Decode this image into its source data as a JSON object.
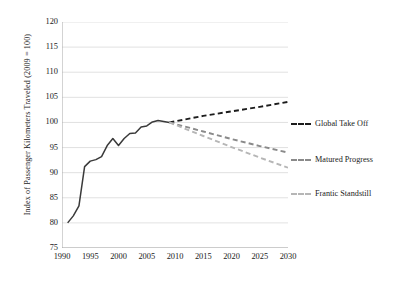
{
  "chart_data": {
    "type": "line",
    "title": "",
    "xlabel": "",
    "ylabel": "Index of Passenger Kilometers Traveled (2009 = 100)",
    "xlim": [
      1990,
      2030
    ],
    "ylim": [
      75,
      120
    ],
    "xticks": [
      "1990",
      "1995",
      "2000",
      "2005",
      "2010",
      "2015",
      "2020",
      "2025",
      "2030"
    ],
    "yticks": [
      "75",
      "80",
      "85",
      "90",
      "95",
      "100",
      "105",
      "110",
      "115",
      "120"
    ],
    "grid": "horizontal",
    "legend_position": "right",
    "series": [
      {
        "name": "Historical",
        "style": "solid",
        "color": "#3a3a3a",
        "show_in_legend": false,
        "x": [
          1991,
          1992,
          1993,
          1994,
          1995,
          1996,
          1997,
          1998,
          1999,
          2000,
          2001,
          2002,
          2003,
          2004,
          2005,
          2006,
          2007,
          2008,
          2009
        ],
        "values": [
          80.0,
          81.4,
          83.4,
          91.2,
          92.3,
          92.6,
          93.2,
          95.4,
          96.8,
          95.4,
          96.8,
          97.8,
          97.9,
          99.1,
          99.3,
          100.1,
          100.4,
          100.2,
          100.0
        ]
      },
      {
        "name": "Global Take Off",
        "style": "dashed",
        "color": "#1c1c1c",
        "show_in_legend": true,
        "x": [
          2009,
          2015,
          2020,
          2025,
          2030
        ],
        "values": [
          100.0,
          101.3,
          102.2,
          103.1,
          104.1
        ]
      },
      {
        "name": "Matured Progress",
        "style": "dashed",
        "color": "#8a8a8a",
        "show_in_legend": true,
        "x": [
          2009,
          2015,
          2020,
          2025,
          2030
        ],
        "values": [
          100.0,
          98.2,
          96.7,
          95.3,
          94.0
        ]
      },
      {
        "name": "Frantic Standstill",
        "style": "dashed",
        "color": "#b6b6b6",
        "show_in_legend": true,
        "x": [
          2009,
          2015,
          2020,
          2025,
          2030
        ],
        "values": [
          100.0,
          97.3,
          95.1,
          93.0,
          91.0
        ]
      }
    ]
  },
  "legend": {
    "items": [
      {
        "label": "Global Take Off",
        "color": "#1c1c1c"
      },
      {
        "label": "Matured Progress",
        "color": "#8a8a8a"
      },
      {
        "label": "Frantic Standstill",
        "color": "#b6b6b6"
      }
    ]
  }
}
